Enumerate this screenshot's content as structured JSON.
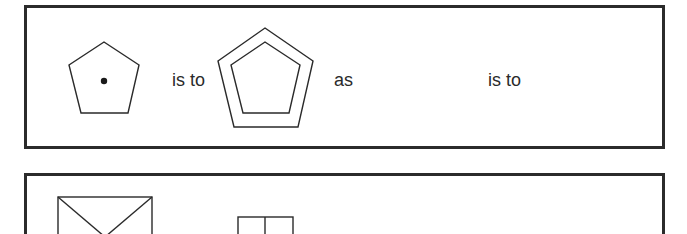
{
  "analogy_problem": {
    "row1": {
      "figure_a": {
        "shape": "pentagon",
        "contains": "dot"
      },
      "connector_1": "is to",
      "figure_b": {
        "shape": "double-pentagon",
        "contains": "nested-pentagon"
      },
      "connector_2": "as",
      "figure_c": {
        "shape": "blank"
      },
      "connector_3": "is to",
      "figure_d": {
        "shape": "blank"
      }
    },
    "row2": {
      "option_1": {
        "shape": "rectangle-with-diagonals"
      },
      "option_2": {
        "shape": "rectangle-with-vertical-divider"
      }
    }
  },
  "colors": {
    "stroke": "#2a2a2a",
    "frame": "#2b2b2b",
    "background": "#ffffff"
  }
}
